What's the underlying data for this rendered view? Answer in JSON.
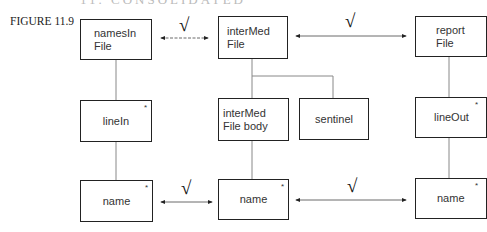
{
  "header": {
    "partial_text": "11. CONSOLIDATED"
  },
  "figure": {
    "label": "FIGURE 11.9"
  },
  "boxes": {
    "namesInFile": {
      "label": "namesIn\nFile",
      "iterated": false
    },
    "interMedFile": {
      "label": "interMed\nFile",
      "iterated": false
    },
    "reportFile": {
      "label": "report\nFile",
      "iterated": false
    },
    "lineIn": {
      "label": "lineIn",
      "iterated": true,
      "marker": "*"
    },
    "interMedFileBody": {
      "label": "interMed\nFile body",
      "iterated": false
    },
    "sentinel": {
      "label": "sentinel",
      "iterated": false
    },
    "lineOut": {
      "label": "lineOut",
      "iterated": true,
      "marker": "*"
    },
    "nameLeft": {
      "label": "name",
      "iterated": true,
      "marker": "*"
    },
    "nameMid": {
      "label": "name",
      "iterated": true,
      "marker": "*"
    },
    "nameRight": {
      "label": "name",
      "iterated": true,
      "marker": "*"
    }
  },
  "correspondences": [
    {
      "from": "namesIn File",
      "to": "interMed File",
      "mark": "√"
    },
    {
      "from": "interMed File",
      "to": "report File",
      "mark": "√"
    },
    {
      "from": "name",
      "to": "name",
      "mark": "√"
    },
    {
      "from": "name",
      "to": "name",
      "mark": "√"
    }
  ],
  "colors": {
    "line": "#222222",
    "connector": "#888888"
  }
}
